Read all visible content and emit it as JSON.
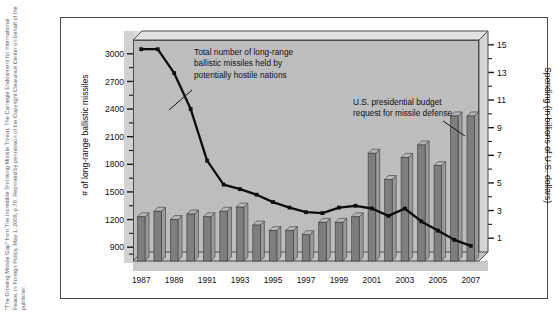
{
  "credit": {
    "text": "\"The Growing Missile Gap\" from The Incredible Shrinking Missile Threat, The Carnegie Endowment for International Peace, in Foreign Policy, May 1, 2008, p.70. Reprinted by permission of the Copyright Clearance Center on behalf of the publisher."
  },
  "annotations": {
    "line_note": [
      "Total number of long-range",
      "ballistic missiles held by",
      "potentially hostile nations"
    ],
    "bar_note": [
      "U.S. presidential budget",
      "request for missile defense"
    ]
  },
  "chart_data": {
    "type": "bar",
    "title": "",
    "xlabel": "",
    "ylabel": "# of long-range ballistic missiles",
    "y2label": "Spending (in billions of U.S. dollars)",
    "grid": false,
    "legend": "none",
    "x": [
      1987,
      1988,
      1989,
      1990,
      1991,
      1992,
      1993,
      1994,
      1995,
      1996,
      1997,
      1998,
      1999,
      2000,
      2001,
      2002,
      2003,
      2004,
      2005,
      2006,
      2007
    ],
    "xtick_labels": [
      "1987",
      "1989",
      "1991",
      "1993",
      "1995",
      "1997",
      "1999",
      "2001",
      "2003",
      "2005",
      "2007"
    ],
    "xtick_values": [
      1987,
      1989,
      1991,
      1993,
      1995,
      1997,
      1999,
      2001,
      2003,
      2005,
      2007
    ],
    "ylim": [
      750,
      3150
    ],
    "ytick_labels": [
      "900",
      "1200",
      "1500",
      "1800",
      "2100",
      "2400",
      "2700",
      "3000"
    ],
    "ytick_values": [
      900,
      1200,
      1500,
      1800,
      2100,
      2400,
      2700,
      3000
    ],
    "y2lim": [
      0,
      16
    ],
    "y2tick_labels": [
      "1",
      "3",
      "5",
      "7",
      "9",
      "11",
      "13",
      "15"
    ],
    "y2tick_values": [
      1,
      3,
      5,
      7,
      9,
      11,
      13,
      15
    ],
    "series": [
      {
        "name": "U.S. presidential budget request for missile defense",
        "type": "bar",
        "axis": "right",
        "unit": "billions of U.S. dollars",
        "values": [
          3.2,
          3.6,
          3.0,
          3.4,
          3.2,
          3.6,
          3.9,
          2.6,
          2.2,
          2.2,
          1.9,
          2.8,
          2.8,
          3.2,
          7.8,
          5.9,
          7.5,
          8.4,
          6.9,
          10.5,
          10.5
        ]
      },
      {
        "name": "Total number of long-range ballistic missiles held by potentially hostile nations",
        "type": "line",
        "axis": "left",
        "unit": "missiles",
        "values": [
          3050,
          3050,
          2790,
          2400,
          1840,
          1580,
          1530,
          1470,
          1390,
          1330,
          1280,
          1270,
          1330,
          1350,
          1320,
          1240,
          1320,
          1180,
          1080,
          980,
          915
        ]
      }
    ]
  }
}
